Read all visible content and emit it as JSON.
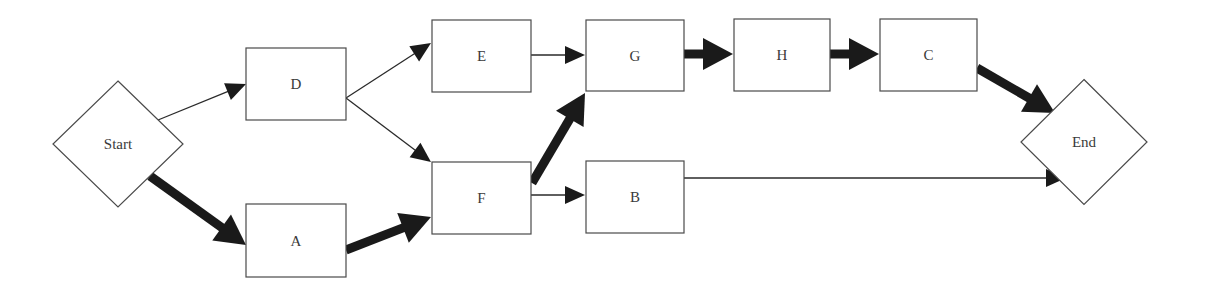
{
  "diagram": {
    "type": "network-flow",
    "canvas": {
      "width": 1217,
      "height": 288
    },
    "colors": {
      "node_stroke": "#4a4a4a",
      "edge": "#1a1a1a",
      "label": "#3a3a3a",
      "background": "#ffffff"
    },
    "nodes": [
      {
        "id": "start",
        "label": "Start",
        "shape": "diamond",
        "cx": 118,
        "cy": 144,
        "w": 130,
        "h": 126
      },
      {
        "id": "D",
        "label": "D",
        "shape": "rect",
        "x": 246,
        "y": 48,
        "w": 100,
        "h": 72
      },
      {
        "id": "A",
        "label": "A",
        "shape": "rect",
        "x": 246,
        "y": 204,
        "w": 100,
        "h": 73
      },
      {
        "id": "E",
        "label": "E",
        "shape": "rect",
        "x": 432,
        "y": 20,
        "w": 99,
        "h": 72
      },
      {
        "id": "F",
        "label": "F",
        "shape": "rect",
        "x": 432,
        "y": 162,
        "w": 99,
        "h": 72
      },
      {
        "id": "G",
        "label": "G",
        "shape": "rect",
        "x": 586,
        "y": 20,
        "w": 98,
        "h": 71
      },
      {
        "id": "B",
        "label": "B",
        "shape": "rect",
        "x": 586,
        "y": 161,
        "w": 98,
        "h": 72
      },
      {
        "id": "H",
        "label": "H",
        "shape": "rect",
        "x": 734,
        "y": 19,
        "w": 96,
        "h": 72
      },
      {
        "id": "C",
        "label": "C",
        "shape": "rect",
        "x": 880,
        "y": 19,
        "w": 97,
        "h": 72
      },
      {
        "id": "end",
        "label": "End",
        "shape": "diamond",
        "cx": 1084,
        "cy": 142,
        "w": 126,
        "h": 125
      }
    ],
    "edges": [
      {
        "from": "start",
        "to": "D",
        "critical": false,
        "x1": 158,
        "y1": 120,
        "x2": 246,
        "y2": 84
      },
      {
        "from": "start",
        "to": "A",
        "critical": true,
        "x1": 150,
        "y1": 176,
        "x2": 246,
        "y2": 245
      },
      {
        "from": "D",
        "to": "E",
        "critical": false,
        "x1": 346,
        "y1": 98,
        "x2": 431,
        "y2": 43
      },
      {
        "from": "D",
        "to": "F",
        "critical": false,
        "x1": 346,
        "y1": 98,
        "x2": 431,
        "y2": 162
      },
      {
        "from": "A",
        "to": "F",
        "critical": true,
        "x1": 346,
        "y1": 250,
        "x2": 431,
        "y2": 217
      },
      {
        "from": "E",
        "to": "G",
        "critical": false,
        "x1": 531,
        "y1": 55,
        "x2": 585,
        "y2": 55
      },
      {
        "from": "F",
        "to": "G",
        "critical": true,
        "x1": 532,
        "y1": 183,
        "x2": 585,
        "y2": 93
      },
      {
        "from": "F",
        "to": "B",
        "critical": false,
        "x1": 531,
        "y1": 195,
        "x2": 585,
        "y2": 195
      },
      {
        "from": "G",
        "to": "H",
        "critical": true,
        "x1": 684,
        "y1": 54,
        "x2": 733,
        "y2": 54
      },
      {
        "from": "H",
        "to": "C",
        "critical": true,
        "x1": 830,
        "y1": 54,
        "x2": 879,
        "y2": 54
      },
      {
        "from": "C",
        "to": "end",
        "critical": true,
        "x1": 977,
        "y1": 68,
        "x2": 1055,
        "y2": 113
      },
      {
        "from": "B",
        "to": "end",
        "critical": false,
        "x1": 684,
        "y1": 178,
        "x2": 1066,
        "y2": 178
      }
    ]
  }
}
